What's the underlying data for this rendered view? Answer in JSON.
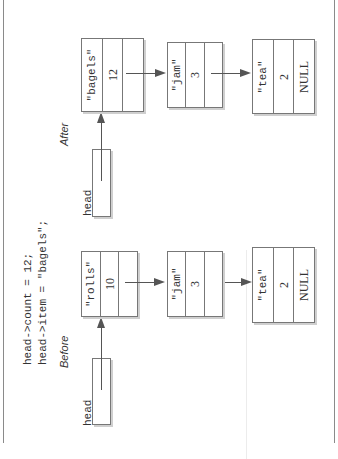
{
  "figure": {
    "orientation": "rotated 90 degrees counterclockwise",
    "code_lines": [
      "head->count = 12;",
      "head->item = \"bagels\";"
    ],
    "panels": [
      {
        "id": "before",
        "title": "Before",
        "head_label": "head",
        "nodes": [
          {
            "item": "\"rolls\"",
            "count": "10",
            "next": ""
          },
          {
            "item": "\"jam\"",
            "count": "3",
            "next": ""
          },
          {
            "item": "\"tea\"",
            "count": "2",
            "next": "NULL"
          }
        ]
      },
      {
        "id": "after",
        "title": "After",
        "head_label": "head",
        "nodes": [
          {
            "item": "\"bagels\"",
            "count": "12",
            "next": ""
          },
          {
            "item": "\"jam\"",
            "count": "3",
            "next": ""
          },
          {
            "item": "\"tea\"",
            "count": "2",
            "next": "NULL"
          }
        ]
      }
    ]
  }
}
